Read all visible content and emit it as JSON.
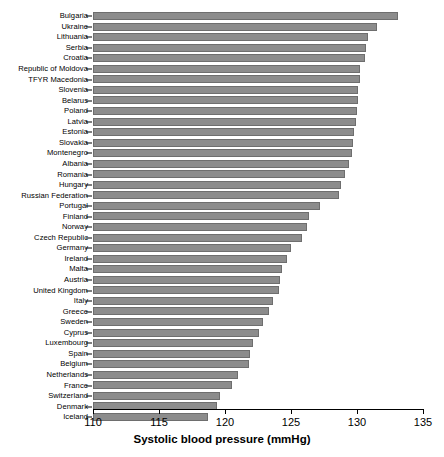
{
  "chart_data": {
    "type": "bar",
    "orientation": "horizontal",
    "title": "",
    "xlabel": "Systolic blood pressure (mmHg)",
    "ylabel": "",
    "xlim": [
      110,
      135
    ],
    "xticks": [
      110,
      115,
      120,
      125,
      130,
      135
    ],
    "grid": false,
    "legend": null,
    "bar_color": "#8c8c8c",
    "bar_edge_color": "#6e6e6e",
    "categories": [
      "Bulgaria",
      "Ukraine",
      "Lithuania",
      "Serbia",
      "Croatia",
      "Republic of Moldova",
      "TFYR Macedonia",
      "Slovenia",
      "Belarus",
      "Poland",
      "Latvia",
      "Estonia",
      "Slovakia",
      "Montenegro",
      "Albania",
      "Romania",
      "Hungary",
      "Russian Federation",
      "Portugal",
      "Finland",
      "Norway",
      "Czech Republic",
      "Germany",
      "Ireland",
      "Malta",
      "Austria",
      "United Kingdom",
      "Italy",
      "Greece",
      "Sweden",
      "Cyprus",
      "Luxembourg",
      "Spain",
      "Belgium",
      "Netherlands",
      "France",
      "Switzerland",
      "Denmark",
      "Iceland"
    ],
    "values": [
      133.1,
      131.5,
      130.8,
      130.7,
      130.6,
      130.2,
      130.2,
      130.1,
      130.1,
      130.0,
      129.9,
      129.8,
      129.7,
      129.6,
      129.4,
      129.1,
      128.8,
      128.6,
      127.2,
      126.4,
      126.2,
      125.8,
      125.0,
      124.7,
      124.3,
      124.2,
      124.1,
      123.6,
      123.3,
      122.9,
      122.6,
      122.1,
      121.9,
      121.8,
      121.0,
      120.5,
      119.6,
      119.4,
      118.7
    ]
  },
  "axis": {
    "tick_labels": [
      "110",
      "115",
      "120",
      "125",
      "130",
      "135"
    ],
    "title": "Systolic blood pressure (mmHg)"
  }
}
